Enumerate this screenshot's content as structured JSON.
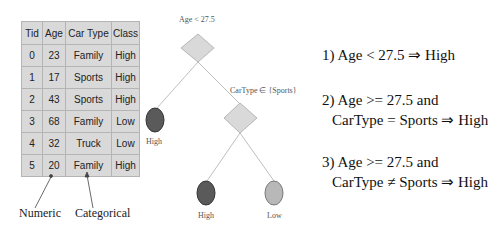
{
  "table": {
    "headers": [
      "Tid",
      "Age",
      "Car Type",
      "Class"
    ],
    "rows": [
      [
        "0",
        "23",
        "Family",
        "High"
      ],
      [
        "1",
        "17",
        "Sports",
        "High"
      ],
      [
        "2",
        "43",
        "Sports",
        "High"
      ],
      [
        "3",
        "68",
        "Family",
        "Low"
      ],
      [
        "4",
        "32",
        "Truck",
        "Low"
      ],
      [
        "5",
        "20",
        "Family",
        "High"
      ]
    ]
  },
  "annotations": {
    "numeric": "Numeric",
    "categorical": "Categorical"
  },
  "tree": {
    "root_condition": "Age < 27.5",
    "child_condition": "CarType ∈ {Sports}",
    "leaves": {
      "left": "High",
      "mid": "High",
      "right": "Low"
    },
    "colors": {
      "decision_fill": "#d9d9d9",
      "high_leaf": "#5a5a5a",
      "low_leaf": "#b8b8b8",
      "edge": "#bfbfbf"
    }
  },
  "rules": {
    "r1": "1) Age < 27.5 ⇒ High",
    "r2_line1": "2) Age >= 27.5 and",
    "r2_line2": "CarType = Sports ⇒ High",
    "r3_line1": "3) Age >= 27.5 and",
    "r3_line2": "CarType ≠ Sports ⇒ High"
  }
}
